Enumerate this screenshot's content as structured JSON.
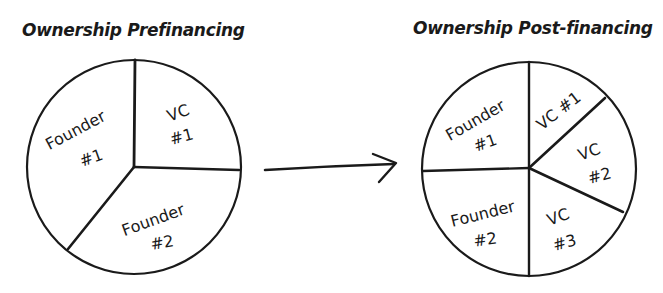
{
  "diagram": {
    "left_chart": {
      "title": "Ownership Prefinancing",
      "slices": [
        {
          "line1": "Founder",
          "line2": "#1"
        },
        {
          "line1": "VC",
          "line2": "#1"
        },
        {
          "line1": "Founder",
          "line2": "#2"
        }
      ]
    },
    "arrow": {
      "direction": "right",
      "meaning": "financing round"
    },
    "right_chart": {
      "title": "Ownership Post-financing",
      "slices": [
        {
          "line1": "Founder",
          "line2": "#1"
        },
        {
          "line1": "VC #1",
          "line2": ""
        },
        {
          "line1": "VC",
          "line2": "#2"
        },
        {
          "line1": "VC",
          "line2": "#3"
        },
        {
          "line1": "Founder",
          "line2": "#2"
        }
      ]
    },
    "colors": {
      "ink": "#1a1a1a",
      "background": "#ffffff"
    }
  }
}
